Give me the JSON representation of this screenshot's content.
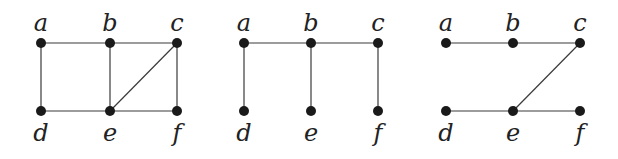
{
  "figure": {
    "width": 618,
    "height": 159,
    "colors": {
      "edge": "#3a3a3a",
      "node": "#1a1a1a",
      "label": "#222222",
      "background": "#ffffff"
    },
    "graphs": [
      {
        "id": "graph-1",
        "description": "Original graph",
        "nodes": [
          {
            "id": "a",
            "label": "a",
            "x": 41,
            "y": 43,
            "label_pos": "above"
          },
          {
            "id": "b",
            "label": "b",
            "x": 110,
            "y": 43,
            "label_pos": "above"
          },
          {
            "id": "c",
            "label": "c",
            "x": 177,
            "y": 43,
            "label_pos": "above"
          },
          {
            "id": "d",
            "label": "d",
            "x": 41,
            "y": 111,
            "label_pos": "below"
          },
          {
            "id": "e",
            "label": "e",
            "x": 110,
            "y": 111,
            "label_pos": "below"
          },
          {
            "id": "f",
            "label": "f",
            "x": 177,
            "y": 111,
            "label_pos": "below"
          }
        ],
        "edges": [
          [
            "a",
            "b"
          ],
          [
            "b",
            "c"
          ],
          [
            "a",
            "d"
          ],
          [
            "b",
            "e"
          ],
          [
            "c",
            "f"
          ],
          [
            "d",
            "e"
          ],
          [
            "e",
            "f"
          ],
          [
            "e",
            "c"
          ]
        ]
      },
      {
        "id": "graph-2",
        "description": "Spanning tree 1",
        "nodes": [
          {
            "id": "a",
            "label": "a",
            "x": 244,
            "y": 43,
            "label_pos": "above"
          },
          {
            "id": "b",
            "label": "b",
            "x": 311,
            "y": 43,
            "label_pos": "above"
          },
          {
            "id": "c",
            "label": "c",
            "x": 378,
            "y": 43,
            "label_pos": "above"
          },
          {
            "id": "d",
            "label": "d",
            "x": 244,
            "y": 111,
            "label_pos": "below"
          },
          {
            "id": "e",
            "label": "e",
            "x": 311,
            "y": 111,
            "label_pos": "below"
          },
          {
            "id": "f",
            "label": "f",
            "x": 378,
            "y": 111,
            "label_pos": "below"
          }
        ],
        "edges": [
          [
            "a",
            "b"
          ],
          [
            "b",
            "c"
          ],
          [
            "a",
            "d"
          ],
          [
            "b",
            "e"
          ],
          [
            "c",
            "f"
          ]
        ]
      },
      {
        "id": "graph-3",
        "description": "Spanning tree 2",
        "nodes": [
          {
            "id": "a",
            "label": "a",
            "x": 446,
            "y": 43,
            "label_pos": "above"
          },
          {
            "id": "b",
            "label": "b",
            "x": 513,
            "y": 43,
            "label_pos": "above"
          },
          {
            "id": "c",
            "label": "c",
            "x": 580,
            "y": 43,
            "label_pos": "above"
          },
          {
            "id": "d",
            "label": "d",
            "x": 446,
            "y": 111,
            "label_pos": "below"
          },
          {
            "id": "e",
            "label": "e",
            "x": 513,
            "y": 111,
            "label_pos": "below"
          },
          {
            "id": "f",
            "label": "f",
            "x": 580,
            "y": 111,
            "label_pos": "below"
          }
        ],
        "edges": [
          [
            "a",
            "b"
          ],
          [
            "b",
            "c"
          ],
          [
            "c",
            "e"
          ],
          [
            "d",
            "e"
          ],
          [
            "e",
            "f"
          ]
        ]
      }
    ]
  }
}
